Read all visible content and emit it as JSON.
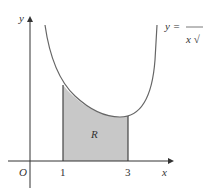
{
  "figure": {
    "curve_label_lhs": "y =",
    "curve_label_den": "x √",
    "region_label": "R",
    "origin_label": "O",
    "x_axis_label": "x",
    "y_axis_label": "y",
    "x_ticks": [
      "1",
      "3"
    ],
    "colors": {
      "shade": "#c8c8c8",
      "line": "#555555",
      "axis": "#333333"
    }
  }
}
